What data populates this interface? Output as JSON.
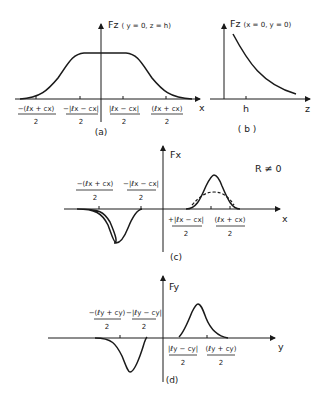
{
  "panels": {
    "a": {
      "caption": "(a)",
      "y_label": "Fz",
      "y_label_args": "( y = 0, z = h)",
      "x_label": "x",
      "ticks": [
        {
          "num": "−(ℓx + cx)",
          "den": "2"
        },
        {
          "num": "−|ℓx − cx|",
          "den": "2"
        },
        {
          "num": "|ℓx − cx|",
          "den": "2"
        },
        {
          "num": "(ℓx + cx)",
          "den": "2"
        }
      ]
    },
    "b": {
      "caption": "( b )",
      "y_label": "Fz",
      "y_label_args": "(x = 0, y = 0)",
      "x_label": "z",
      "tick": "h"
    },
    "c": {
      "caption": "(c)",
      "y_label": "Fx",
      "x_label": "x",
      "annotation": "R ≠ 0",
      "ticks": [
        {
          "num": "−(ℓx + cx)",
          "den": "2"
        },
        {
          "num": "−|ℓx − cx|",
          "den": "2"
        },
        {
          "num": "+|ℓx − cx|",
          "den": "2"
        },
        {
          "num": "(ℓx + cx)",
          "den": "2"
        }
      ]
    },
    "d": {
      "caption": "(d)",
      "y_label": "Fy",
      "x_label": "y",
      "ticks": [
        {
          "num": "−(ℓy + cy)",
          "den": "2"
        },
        {
          "num": "−|ℓy − cy|",
          "den": "2"
        },
        {
          "num": "|ℓy − cy|",
          "den": "2"
        },
        {
          "num": "(ℓy + cy)",
          "den": "2"
        }
      ]
    }
  }
}
